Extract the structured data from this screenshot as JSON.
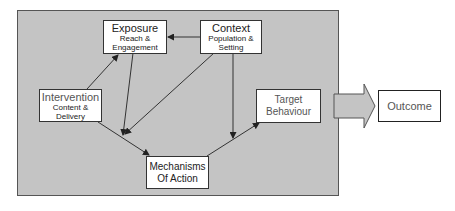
{
  "nodes": {
    "exposure": {
      "title": "Exposure",
      "sub1": "Reach &",
      "sub2": "Engagement"
    },
    "context": {
      "title": "Context",
      "sub1": "Population &",
      "sub2": "Setting"
    },
    "intervention": {
      "title": "Intervention",
      "sub1": "Content &",
      "sub2": "Delivery"
    },
    "target": {
      "line1": "Target",
      "line2": "Behaviour"
    },
    "mechanisms": {
      "line1": "Mechanisms",
      "line2": "Of Action"
    },
    "outcome": {
      "title": "Outcome"
    }
  },
  "edges": [
    {
      "from": "context",
      "to": "exposure"
    },
    {
      "from": "intervention",
      "to": "exposure"
    },
    {
      "from": "exposure",
      "to": "mechanisms-edge"
    },
    {
      "from": "context",
      "to": "mechanisms-edge"
    },
    {
      "from": "intervention",
      "to": "mechanisms"
    },
    {
      "from": "context",
      "to": "target-edge"
    },
    {
      "from": "mechanisms",
      "to": "target"
    },
    {
      "from": "panel",
      "to": "outcome"
    }
  ],
  "colors": {
    "panel": "#c4c4c4",
    "box": "#ffffff",
    "arrow": "#333333"
  }
}
